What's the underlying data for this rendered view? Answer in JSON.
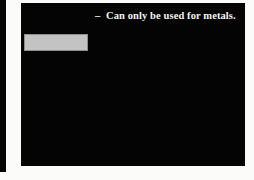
{
  "slide": {
    "background_color": "#040404",
    "text_color": "#f2f2f0",
    "page_background": "#fbfbfa",
    "adjacent_edge_color": "#050505",
    "bullets": [
      {
        "marker": "–",
        "text": "Can only be used for metals."
      }
    ],
    "placeholder": {
      "fill_color": "#c3c3c3",
      "border_color": "#8e8e8e",
      "label": ""
    }
  }
}
